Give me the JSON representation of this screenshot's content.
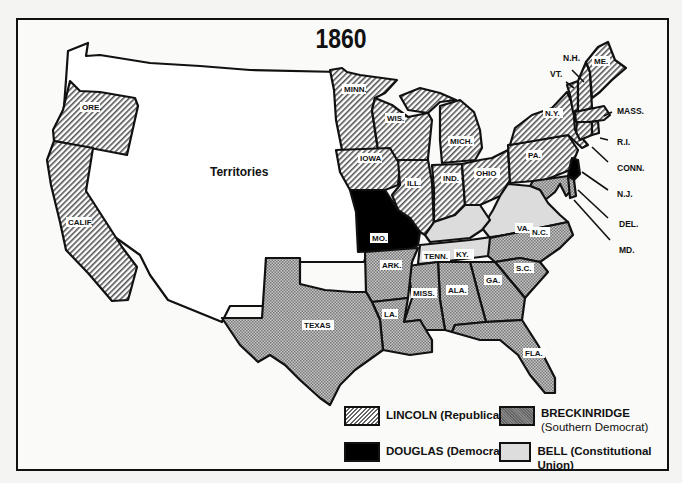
{
  "title": "1860",
  "map": {
    "territories_label": "Territories",
    "states": [
      {
        "abbr": "ORE.",
        "candidate": "lincoln"
      },
      {
        "abbr": "CALIF.",
        "candidate": "lincoln"
      },
      {
        "abbr": "MINN.",
        "candidate": "lincoln"
      },
      {
        "abbr": "WIS.",
        "candidate": "lincoln"
      },
      {
        "abbr": "IOWA",
        "candidate": "lincoln"
      },
      {
        "abbr": "MICH.",
        "candidate": "lincoln"
      },
      {
        "abbr": "ILL.",
        "candidate": "lincoln"
      },
      {
        "abbr": "IND.",
        "candidate": "lincoln"
      },
      {
        "abbr": "OHIO",
        "candidate": "lincoln"
      },
      {
        "abbr": "PA.",
        "candidate": "lincoln"
      },
      {
        "abbr": "N.Y.",
        "candidate": "lincoln"
      },
      {
        "abbr": "VT.",
        "candidate": "lincoln"
      },
      {
        "abbr": "N.H.",
        "candidate": "lincoln"
      },
      {
        "abbr": "ME.",
        "candidate": "lincoln"
      },
      {
        "abbr": "MASS.",
        "candidate": "lincoln"
      },
      {
        "abbr": "R.I.",
        "candidate": "lincoln"
      },
      {
        "abbr": "CONN.",
        "candidate": "lincoln"
      },
      {
        "abbr": "N.J.",
        "candidate": "douglas"
      },
      {
        "abbr": "MO.",
        "candidate": "douglas"
      },
      {
        "abbr": "KY.",
        "candidate": "bell"
      },
      {
        "abbr": "TENN.",
        "candidate": "bell"
      },
      {
        "abbr": "VA.",
        "candidate": "bell"
      },
      {
        "abbr": "DEL.",
        "candidate": "breckinridge"
      },
      {
        "abbr": "MD.",
        "candidate": "breckinridge"
      },
      {
        "abbr": "N.C.",
        "candidate": "breckinridge"
      },
      {
        "abbr": "S.C.",
        "candidate": "breckinridge"
      },
      {
        "abbr": "GA.",
        "candidate": "breckinridge"
      },
      {
        "abbr": "FLA.",
        "candidate": "breckinridge"
      },
      {
        "abbr": "ALA.",
        "candidate": "breckinridge"
      },
      {
        "abbr": "MISS.",
        "candidate": "breckinridge"
      },
      {
        "abbr": "LA.",
        "candidate": "breckinridge"
      },
      {
        "abbr": "ARK.",
        "candidate": "breckinridge"
      },
      {
        "abbr": "TEXAS",
        "candidate": "breckinridge"
      }
    ],
    "callouts": [
      "N.H.",
      "VT.",
      "MASS.",
      "R.I.",
      "CONN.",
      "N.J.",
      "DEL.",
      "MD."
    ]
  },
  "legend": {
    "items": [
      {
        "key": "lincoln",
        "label": "LINCOLN (Republican)"
      },
      {
        "key": "breckinridge",
        "label": "BRECKINRIDGE",
        "sublabel": "(Southern Democrat)"
      },
      {
        "key": "douglas",
        "label": "DOUGLAS (Democrat)"
      },
      {
        "key": "bell",
        "label": "BELL (Constitutional Union)"
      }
    ]
  },
  "colors": {
    "lincoln_hatch": "#555555",
    "breckinridge": "#a8a8a8",
    "douglas": "#000000",
    "bell": "#d8d8d8",
    "territories": "#ffffff",
    "border": "#111111"
  }
}
